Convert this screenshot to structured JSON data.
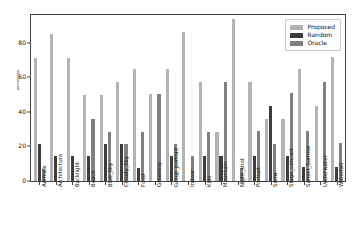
{
  "chart_data": {
    "type": "bar",
    "title": "",
    "xlabel": "",
    "ylabel": "percentage",
    "ylim": [
      0,
      96
    ],
    "yticks": [
      0,
      20,
      40,
      60,
      80
    ],
    "grid": false,
    "legend_position": "upper right",
    "categories": [
      "Animals",
      "Architecture",
      "Backlight",
      "Beach",
      "Blue_Sky",
      "Cloudy_Sky",
      "Food",
      "Greenery",
      "Group_portrait",
      "Indoor",
      "Kids",
      "Mountain",
      "Night_shot",
      "Portrait",
      "Snow",
      "Stage_concert",
      "Sunset_Sunrise",
      "Underwater",
      "Waterfall"
    ],
    "series": [
      {
        "name": "Proposed",
        "color": "#b4b4b4",
        "values": [
          71,
          85,
          71,
          50,
          50,
          57.5,
          64.5,
          50.5,
          64.5,
          86,
          57.5,
          28.5,
          93.5,
          57.5,
          36,
          36,
          64.5,
          43.5,
          71.5
        ]
      },
      {
        "name": "Random",
        "color": "#3d3d3d",
        "values": [
          21.5,
          14.5,
          14.5,
          14.5,
          21.5,
          21.5,
          7.5,
          0,
          14.5,
          0,
          14.5,
          14.5,
          0,
          14.5,
          43.5,
          14.5,
          8,
          0,
          8
        ]
      },
      {
        "name": "Oracle",
        "color": "#808080",
        "values": [
          7,
          0,
          0,
          36,
          28.5,
          21.5,
          28.5,
          50.5,
          21.5,
          14.5,
          28.5,
          57.5,
          7.5,
          29,
          21.5,
          51,
          29,
          57.5,
          22
        ]
      }
    ]
  },
  "legend": {
    "items": [
      {
        "label": "Proposed",
        "swatch": "proposed"
      },
      {
        "label": "Random",
        "swatch": "random"
      },
      {
        "label": "Oracle",
        "swatch": "oracle"
      }
    ]
  }
}
